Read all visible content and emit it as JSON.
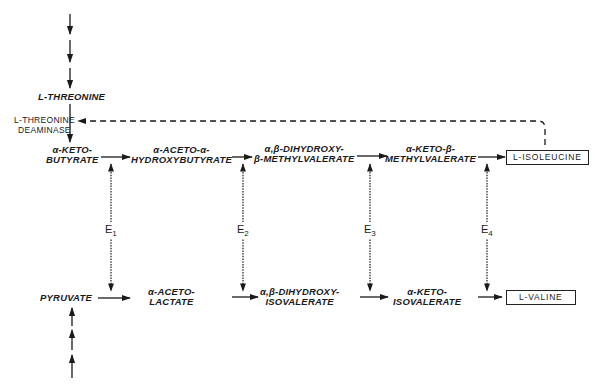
{
  "upstream": {
    "threonine": "L-THREONINE",
    "enzyme_label": [
      "L-THREONINE",
      "DEAMINASE"
    ]
  },
  "isoleucine_pathway": [
    {
      "line1": "α-KETO-",
      "line2": "BUTYRATE"
    },
    {
      "line1": "α-ACETO-α-",
      "line2": "HYDROXYBUTYRATE"
    },
    {
      "line1": "α,β-DIHYDROXY-",
      "line2": "β-METHYLVALERATE"
    },
    {
      "line1": "α-KETO-β-",
      "line2": "METHYLVALERATE"
    }
  ],
  "valine_pathway": [
    {
      "line1": "PYRUVATE",
      "line2": ""
    },
    {
      "line1": "α-ACETO-",
      "line2": "LACTATE"
    },
    {
      "line1": "α,β-DIHYDROXY-",
      "line2": "ISOVALERATE"
    },
    {
      "line1": "α-KETO-",
      "line2": "ISOVALERATE"
    }
  ],
  "products": {
    "isoleucine": "L-ISOLEUCINE",
    "valine": "L-VALINE"
  },
  "enzymes": [
    {
      "label": "E",
      "sub": "1"
    },
    {
      "label": "E",
      "sub": "2"
    },
    {
      "label": "E",
      "sub": "3"
    },
    {
      "label": "E",
      "sub": "4"
    }
  ],
  "feedback": "L-ISOLEUCINE inhibits L-THREONINE DEAMINASE (dashed line)"
}
